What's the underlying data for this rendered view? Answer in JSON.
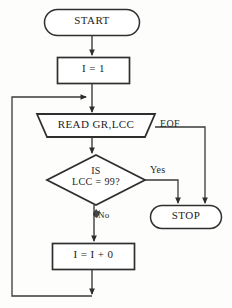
{
  "diagram": {
    "background_color": "#fdfdfb",
    "line_color": "#3a3a3a",
    "text_color": "#1d1d1d"
  },
  "nodes": {
    "start": {
      "label": "START",
      "shape": "terminal"
    },
    "init": {
      "label": "I = 1",
      "shape": "process"
    },
    "read": {
      "label": "READ GR,LCC",
      "shape": "input-output"
    },
    "decision_line1": "IS",
    "decision_line2": "LCC = 99?",
    "stop": {
      "label": "STOP",
      "shape": "terminal"
    },
    "increment": {
      "label": "I = I + 0",
      "shape": "process"
    }
  },
  "edges": {
    "eof_label": "EOF",
    "yes_label": "Yes",
    "no_label": "No"
  }
}
